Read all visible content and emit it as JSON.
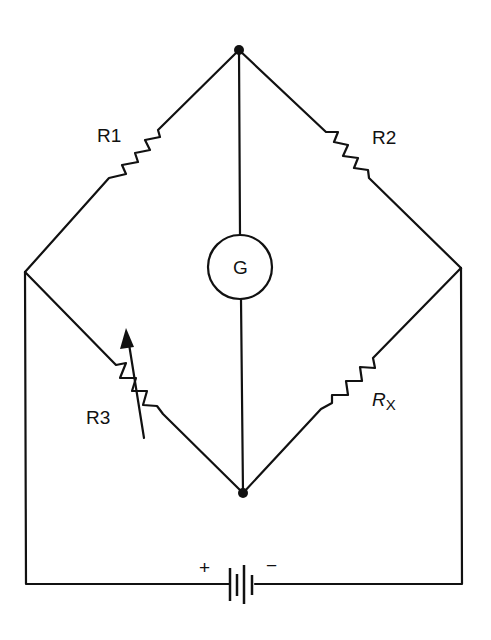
{
  "diagram": {
    "components": {
      "r1": {
        "label": "R1"
      },
      "r2": {
        "label": "R2"
      },
      "r3": {
        "label": "R3",
        "type": "variable resistor"
      },
      "rx": {
        "label": "R",
        "subscript": "X"
      },
      "galvanometer": {
        "label": "G"
      },
      "battery": {
        "plus": "+",
        "minus": "−"
      }
    },
    "nodes": {
      "top": [
        239,
        50
      ],
      "left": [
        25,
        272
      ],
      "right": [
        461,
        268
      ],
      "bottom": [
        243,
        493
      ]
    },
    "colors": {
      "ink": "#111111",
      "background": "#ffffff"
    }
  }
}
